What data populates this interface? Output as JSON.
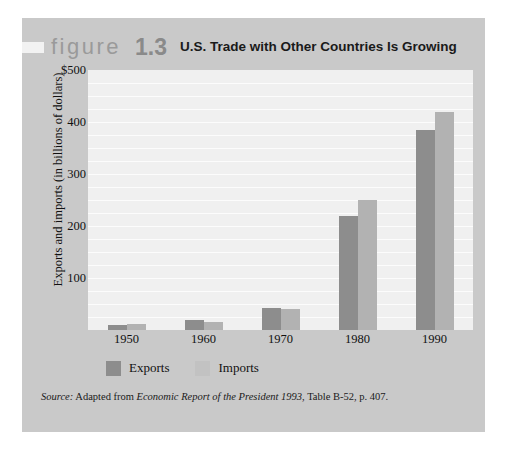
{
  "figure": {
    "word": "figure",
    "number": "1.3",
    "title": "U.S. Trade with Other Countries Is Growing"
  },
  "source": {
    "label": "Source:",
    "prefix": " Adapted from ",
    "work": "Economic Report of the President 1993",
    "suffix": ", Table B-52, p. 407."
  },
  "colors": {
    "exports": "#8d8d8d",
    "imports": "#b2b2b2",
    "panel": "#c9c9c9",
    "plot": "#f0f0f0",
    "gridline": "#fcfcfc"
  },
  "chart_data": {
    "type": "bar",
    "title": "U.S. Trade with Other Countries Is Growing",
    "xlabel": "",
    "ylabel": "Exports and imports (in billions of dollars)",
    "categories": [
      "1950",
      "1960",
      "1970",
      "1980",
      "1990"
    ],
    "series": [
      {
        "name": "Exports",
        "values": [
          10,
          20,
          43,
          220,
          385
        ],
        "color": "#8d8d8d"
      },
      {
        "name": "Imports",
        "values": [
          12,
          15,
          40,
          250,
          420
        ],
        "color": "#b2b2b2"
      }
    ],
    "ylim": [
      0,
      500
    ],
    "ytick_labels": [
      "$500",
      "400",
      "300",
      "200",
      "100"
    ],
    "ytick_values": [
      500,
      400,
      300,
      200,
      100
    ],
    "gridlines_at": [
      25,
      50,
      75,
      100,
      125,
      150,
      175,
      200,
      225,
      250,
      275,
      300,
      325,
      350,
      375,
      400,
      425,
      450,
      475
    ],
    "grid": true,
    "legend_position": "bottom-left"
  }
}
